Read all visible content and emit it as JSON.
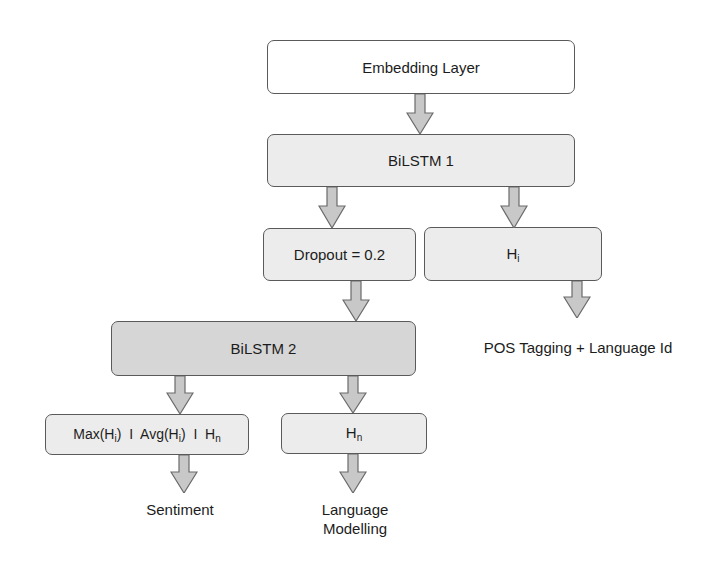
{
  "diagram": {
    "nodes": {
      "embedding": {
        "label": "Embedding Layer"
      },
      "bilstm1": {
        "label": "BiLSTM 1"
      },
      "dropout": {
        "label": "Dropout = 0.2"
      },
      "hi": {
        "label": "H",
        "sub": "i"
      },
      "bilstm2": {
        "label": "BiLSTM 2"
      },
      "pooling": {
        "parts": [
          {
            "label": "Max(H",
            "sub": "i",
            "after": ")"
          },
          {
            "sep": "I"
          },
          {
            "label": "Avg(H",
            "sub": "i",
            "after": ")"
          },
          {
            "sep": "I"
          },
          {
            "label": "H",
            "sub": "n"
          }
        ]
      },
      "hn": {
        "label": "H",
        "sub": "n"
      }
    },
    "outputs": {
      "pos": "POS Tagging + Language Id",
      "sentiment": "Sentiment",
      "lm_line1": "Language",
      "lm_line2": "Modelling"
    },
    "edges": [
      [
        "Embedding Layer",
        "BiLSTM 1"
      ],
      [
        "BiLSTM 1",
        "Dropout = 0.2"
      ],
      [
        "BiLSTM 1",
        "Hi"
      ],
      [
        "Hi",
        "POS Tagging + Language Id"
      ],
      [
        "Dropout = 0.2",
        "BiLSTM 2"
      ],
      [
        "BiLSTM 2",
        "Max(Hi) | Avg(Hi) | Hn"
      ],
      [
        "BiLSTM 2",
        "Hn"
      ],
      [
        "Max(Hi) | Avg(Hi) | Hn",
        "Sentiment"
      ],
      [
        "Hn",
        "Language Modelling"
      ]
    ],
    "colors": {
      "white_box": "#ffffff",
      "light_box": "#ececec",
      "mid_box": "#d6d6d6",
      "arrow_fill": "#c8c8c8",
      "stroke": "#5a5a5a"
    }
  }
}
